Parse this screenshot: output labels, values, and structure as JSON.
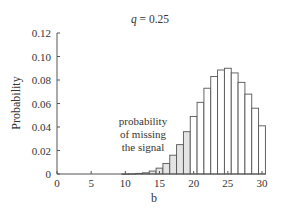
{
  "chart_data": {
    "type": "bar",
    "title": "q = 0.25",
    "title_var": "q",
    "title_rest": " = 0.25",
    "xlabel": "b",
    "ylabel": "Probability",
    "xlim": [
      0,
      30
    ],
    "ylim": [
      0,
      0.12
    ],
    "x_ticks": [
      0,
      5,
      10,
      15,
      20,
      25,
      30
    ],
    "x_tick_labels": [
      "0",
      "5",
      "10",
      "15",
      "20",
      "25",
      "30"
    ],
    "y_ticks": [
      0,
      0.02,
      0.04,
      0.06,
      0.08,
      0.1,
      0.12
    ],
    "y_tick_labels": [
      "0",
      "0.02",
      "0.04",
      "0.06",
      "0.08",
      "0.10",
      "0.12"
    ],
    "grid": false,
    "x": [
      0,
      1,
      2,
      3,
      4,
      5,
      6,
      7,
      8,
      9,
      10,
      11,
      12,
      13,
      14,
      15,
      16,
      17,
      18,
      19,
      20,
      21,
      22,
      23,
      24,
      25,
      26,
      27,
      28,
      29,
      30
    ],
    "values": [
      0,
      0,
      0,
      0,
      0,
      0,
      0,
      0,
      0,
      0,
      0.0001,
      0.0002,
      0.0005,
      0.001,
      0.0025,
      0.005,
      0.009,
      0.016,
      0.025,
      0.036,
      0.049,
      0.061,
      0.073,
      0.083,
      0.0885,
      0.09,
      0.086,
      0.078,
      0.068,
      0.056,
      0.041
    ],
    "shaded_threshold": 19,
    "shaded_fill": "#e4e4e4",
    "unshaded_fill": "#ffffff",
    "annotation": {
      "lines": [
        "probability",
        "of missing",
        "the signal"
      ]
    }
  }
}
